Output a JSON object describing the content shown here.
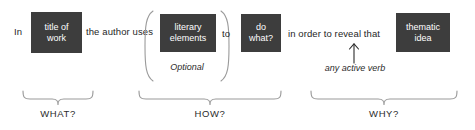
{
  "diagram": {
    "sentence": {
      "lead_text": "In",
      "connector_1": "the author uses",
      "connector_2": "to",
      "connector_3": "in order to reveal that"
    },
    "slots": [
      {
        "id": "title-of-work",
        "line1": "title of",
        "line2": "work"
      },
      {
        "id": "literary-elements",
        "line1": "literary",
        "line2": "elements"
      },
      {
        "id": "do-what",
        "line1": "do",
        "line2": "what?"
      },
      {
        "id": "thematic-idea",
        "line1": "thematic",
        "line2": "idea"
      }
    ],
    "annotations": {
      "optional": "Optional",
      "active_verb": "any active verb"
    },
    "categories": [
      {
        "id": "what",
        "label": "WHAT?"
      },
      {
        "id": "how",
        "label": "HOW?"
      },
      {
        "id": "why",
        "label": "WHY?"
      }
    ],
    "colors": {
      "slot_background": "#3d3d3d",
      "slot_text": "#ffffff",
      "body_text": "#262626",
      "brace_stroke": "#9a9a9a",
      "page_background": "#ffffff"
    }
  }
}
